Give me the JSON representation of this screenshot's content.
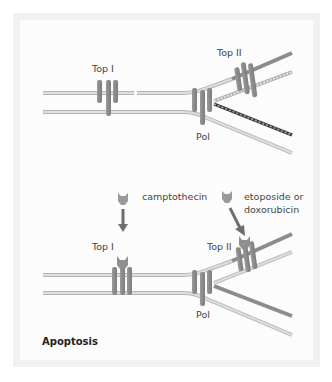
{
  "diagram": {
    "top_panel": {
      "labels": {
        "top1": "Top I",
        "top2": "Top II",
        "pol": "Pol"
      }
    },
    "bottom_panel": {
      "labels": {
        "top1": "Top I",
        "top2": "Top II",
        "pol": "Pol",
        "drug1": "camptothecin",
        "drug2_line1": "etoposide or",
        "drug2_line2": "doxorubicin",
        "outcome": "Apoptosis"
      }
    },
    "colors": {
      "frame": "#f1f1f1",
      "panel": "#fcfcfc",
      "strand_light": "#d9d9d9",
      "strand_edge": "#b5b5b5",
      "strand_dark": "#8c8c8c",
      "enzyme": "#8f8f8f",
      "arrow": "#6e6e6e",
      "drug": "#9a9a9a",
      "text": "#444444"
    }
  }
}
